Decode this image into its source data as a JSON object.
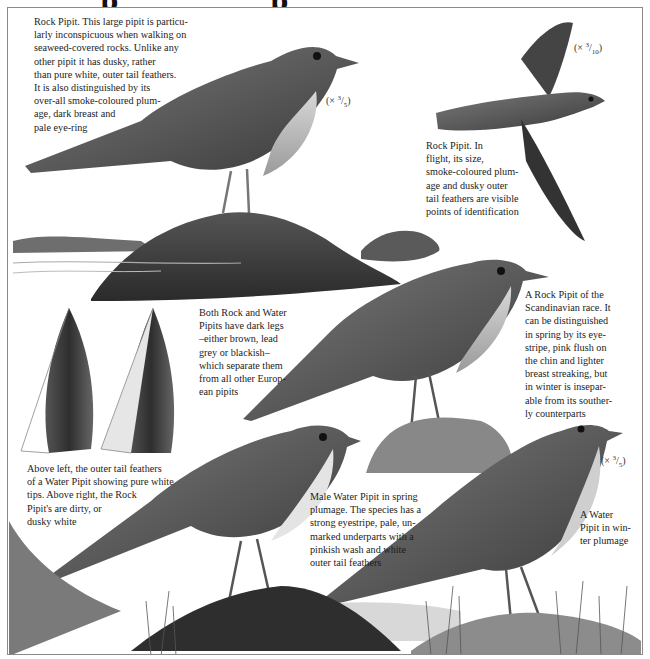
{
  "page": {
    "title_fragment_glyphs": [
      "p",
      "p"
    ]
  },
  "captions": {
    "rock_pipit_perched": "Rock Pipit. This large pipit is particu-\nlarly inconspicuous when walking on\nseaweed-covered rocks. Unlike any\nother pipit it has dusky, rather\nthan pure white, outer tail feathers.\nIt is also distinguished by its\nover-all smoke-coloured plum-\nage, dark breast and\npale eye-ring",
    "rock_pipit_flight": "Rock Pipit. In\nflight, its size,\nsmoke-coloured plum-\nage and dusky outer\ntail feathers are visible\npoints of identification",
    "legs_note": "Both Rock and Water\nPipits have dark legs\n–either brown, lead\ngrey or blackish–\nwhich separate them\nfrom all other Europ-\nean pipits",
    "scandinavian_race": "A Rock Pipit of the\nScandinavian race. It\ncan be distinguished\nin spring by its eye-\nstripe, pink flush on\nthe chin and lighter\nbreast streaking, but\nin winter is insepar-\nable from its souther-\nly counterparts",
    "tail_feathers": "Above left, the outer tail feathers\nof a Water Pipit showing pure white\ntips. Above right, the Rock\nPipit's are dirty, or\ndusky white",
    "male_water_pipit": "Male Water Pipit in spring\nplumage. The species has a\nstrong eyestripe, pale, un-\nmarked underparts with a\npinkish wash and white\nouter tail feathers",
    "water_pipit_winter": "A Water\nPipit in win-\nter plumage"
  },
  "scales": {
    "perched_rock_pipit": {
      "prefix": "(×",
      "num": "3",
      "den": "5",
      "suffix": ")"
    },
    "flight_rock_pipit": {
      "prefix": "(×",
      "num": "3",
      "den": "10",
      "suffix": ")"
    },
    "winter_water_pipit": {
      "prefix": "(×",
      "num": "3",
      "den": "5",
      "suffix": ")"
    }
  },
  "colors": {
    "frame_border": "#8a8a8a",
    "ink_dark": "#222222",
    "ink_mid": "#6b6b6b",
    "ink_light": "#bdbdbd"
  }
}
